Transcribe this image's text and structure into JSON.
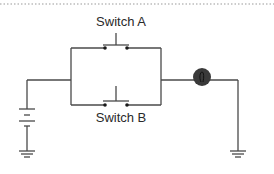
{
  "diagram": {
    "type": "circuit-schematic",
    "colors": {
      "wire": "#4a4a4a",
      "contact": "#1a1a1a",
      "lamp": "#3a3a3a",
      "border": "#9a9a9a",
      "text": "#2a2a2a"
    },
    "components": {
      "switch_a": {
        "label": "Switch A",
        "kind": "push-button-switch"
      },
      "switch_b": {
        "label": "Switch B",
        "kind": "push-button-switch"
      },
      "lamp": {
        "kind": "light-bulb",
        "symbol": "ℓ"
      },
      "battery": {
        "kind": "battery"
      },
      "ground_left": {
        "kind": "ground"
      },
      "ground_right": {
        "kind": "ground"
      }
    }
  }
}
